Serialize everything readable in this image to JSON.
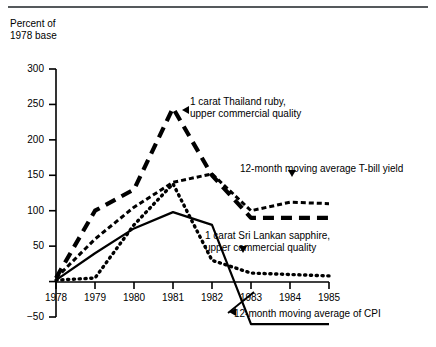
{
  "axis_caption": "Percent of\n1978 base",
  "chart_data": {
    "type": "line",
    "title": "",
    "subtitle": "",
    "xlabel": "",
    "ylabel": "Percent of 1978 base",
    "x": [
      1978,
      1979,
      1980,
      1981,
      1982,
      1983,
      1984,
      1985
    ],
    "categories": [
      "1978",
      "1979",
      "1980",
      "1981",
      "1982",
      "1983",
      "1984",
      "1985"
    ],
    "ylim": [
      -50,
      300
    ],
    "yticks": [
      -50,
      0,
      50,
      100,
      150,
      200,
      250,
      300
    ],
    "ytick_labels": [
      "−50",
      "0",
      "50",
      "100",
      "150",
      "200",
      "250",
      "300"
    ],
    "xlim": [
      1978,
      1985
    ],
    "grid": false,
    "legend": "annotations",
    "series": [
      {
        "name": "1 carat Thailand ruby, upper commercial quality",
        "style": "thick-dashed",
        "color": "#000000",
        "values": [
          5,
          100,
          130,
          245,
          150,
          90,
          90,
          90
        ]
      },
      {
        "name": "12-month moving average T-bill yield",
        "style": "fine-dashed",
        "color": "#000000",
        "values": [
          5,
          60,
          105,
          140,
          152,
          100,
          112,
          110
        ]
      },
      {
        "name": "1 carat Sri Lankan sapphire, upper commercial quality",
        "style": "dotted",
        "color": "#000000",
        "values": [
          2,
          5,
          80,
          138,
          30,
          12,
          10,
          8
        ]
      },
      {
        "name": "12-month moving average of CPI",
        "style": "solid",
        "color": "#000000",
        "values": [
          2,
          40,
          75,
          98,
          80,
          -60,
          -60,
          -60
        ]
      }
    ],
    "annotations": [
      {
        "id": "ruby-annotation",
        "text": "1 carat Thailand ruby,\nupper commercial quality",
        "marker": "arrow-left"
      },
      {
        "id": "tbill-annotation",
        "text": "12-month moving average T-bill yield",
        "marker": "arrow-down"
      },
      {
        "id": "sapphire-annotation",
        "text": "1 carat Sri Lankan sapphire,\nupper commercial quality",
        "marker": "arrow-down"
      },
      {
        "id": "cpi-annotation",
        "text": "12-month moving average of CPI",
        "marker": "arrow-left-leader"
      }
    ]
  }
}
